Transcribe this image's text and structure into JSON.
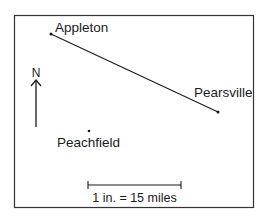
{
  "map": {
    "towns": [
      {
        "name": "Appleton",
        "x": 51,
        "y": 34
      },
      {
        "name": "Pearsville",
        "x": 218,
        "y": 112
      },
      {
        "name": "Peachfield",
        "x": 89,
        "y": 131
      }
    ],
    "road": {
      "from": "Appleton",
      "to": "Pearsville"
    },
    "compass": {
      "label": "N"
    },
    "scale": {
      "label": "1 in. = 15 miles"
    }
  },
  "colors": {
    "ink": "#1a1a1a",
    "frame": "#333333",
    "background": "#ffffff"
  }
}
